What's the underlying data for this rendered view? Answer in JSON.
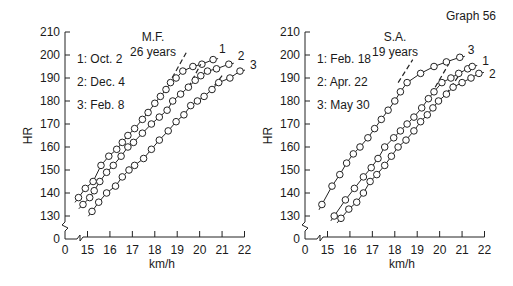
{
  "graph_label": "Graph 56",
  "chart_data": [
    {
      "type": "line",
      "title": "M.F.",
      "subtitle": "26 years",
      "xlabel": "km/h",
      "ylabel": "HR",
      "x_ticks": [
        "0",
        "15",
        "16",
        "17",
        "18",
        "19",
        "20",
        "21",
        "22"
      ],
      "y_ticks": [
        "0",
        "130",
        "140",
        "150",
        "160",
        "170",
        "180",
        "190",
        "200",
        "210"
      ],
      "xlim": [
        14.3,
        22
      ],
      "ylim": [
        125,
        210
      ],
      "axis_breaks": true,
      "grid": false,
      "legend_position": "top-left",
      "legend": [
        "1: Oct. 2",
        "2: Dec. 4",
        "3: Feb. 8"
      ],
      "series": [
        {
          "name": "1",
          "label": "1: Oct. 2",
          "x": [
            14.6,
            14.9,
            15.25,
            15.6,
            15.95,
            16.3,
            16.55,
            16.8,
            17.1,
            17.45,
            17.7,
            18.0,
            18.25,
            18.5,
            18.7,
            18.95,
            19.25,
            19.7,
            20.1,
            20.6
          ],
          "y": [
            138,
            142,
            145,
            152,
            156,
            159,
            162,
            165,
            168,
            172,
            175,
            179,
            182,
            185,
            188,
            190,
            193,
            195,
            196,
            198
          ],
          "deflection_dashed": {
            "x": [
              18.6,
              19.4
            ],
            "y": [
              187,
              201
            ]
          }
        },
        {
          "name": "2",
          "label": "2: Dec. 4",
          "x": [
            14.8,
            15.1,
            15.3,
            15.55,
            15.85,
            16.15,
            16.5,
            16.8,
            17.05,
            17.45,
            17.85,
            18.2,
            18.55,
            18.8,
            19.15,
            19.5,
            19.8,
            20.05,
            20.35,
            20.75,
            21.3
          ],
          "y": [
            135,
            138,
            141,
            145,
            149,
            152,
            156,
            160,
            162,
            166,
            170,
            173,
            176,
            180,
            183,
            186,
            189,
            191,
            193,
            194,
            196
          ],
          "deflection_dashed": {
            "x": [
              19.5,
              20.05
            ],
            "y": [
              186,
              196
            ]
          }
        },
        {
          "name": "3",
          "label": "3: Feb. 8",
          "x": [
            15.2,
            15.5,
            15.85,
            16.25,
            16.55,
            16.85,
            17.1,
            17.5,
            17.85,
            18.2,
            18.6,
            18.95,
            19.3,
            19.6,
            19.9,
            20.2,
            20.55,
            20.85,
            21.35,
            21.8
          ],
          "y": [
            132,
            136,
            140,
            143,
            147,
            150,
            152,
            155,
            159,
            163,
            167,
            171,
            174,
            178,
            180,
            182,
            185,
            188,
            190,
            193
          ],
          "deflection_dashed": {
            "x": [
              20.45,
              21.0
            ],
            "y": [
              184,
              191
            ]
          }
        }
      ],
      "series_end_labels": [
        "1",
        "2",
        "3"
      ]
    },
    {
      "type": "line",
      "title": "S.A.",
      "subtitle": "19 years",
      "xlabel": "km/h",
      "ylabel": "HR",
      "x_ticks": [
        "0",
        "15",
        "16",
        "17",
        "18",
        "19",
        "20",
        "21",
        "22"
      ],
      "y_ticks": [
        "0",
        "130",
        "140",
        "150",
        "160",
        "170",
        "180",
        "190",
        "200",
        "210"
      ],
      "xlim": [
        14.3,
        22
      ],
      "ylim": [
        125,
        210
      ],
      "axis_breaks": true,
      "grid": false,
      "legend_position": "top-left",
      "legend": [
        "1: Feb. 18",
        "2: Apr. 22",
        "3: May 30"
      ],
      "series": [
        {
          "name": "3",
          "label": "3: May 30",
          "x": [
            14.75,
            15.2,
            15.55,
            15.85,
            16.15,
            16.45,
            16.8,
            17.1,
            17.4,
            17.7,
            18.0,
            18.25,
            18.55,
            19.15,
            19.75,
            20.3,
            20.9
          ],
          "y": [
            135,
            143,
            148,
            153,
            157,
            160,
            164,
            168,
            172,
            176,
            180,
            184,
            188,
            192,
            195,
            197,
            199
          ],
          "deflection_dashed": {
            "x": [
              18.15,
              18.8
            ],
            "y": [
              188,
              198
            ]
          }
        },
        {
          "name": "1",
          "label": "1: Feb. 18",
          "x": [
            15.3,
            15.8,
            16.2,
            16.6,
            16.95,
            17.25,
            17.55,
            17.95,
            18.25,
            18.55,
            18.85,
            19.2,
            19.5,
            19.75,
            20.1,
            20.5,
            20.85,
            21.25,
            21.45
          ],
          "y": [
            130,
            137,
            142,
            147,
            151,
            155,
            160,
            164,
            167,
            170,
            173,
            177,
            181,
            184,
            188,
            190,
            192,
            194,
            195
          ],
          "deflection_dashed": {
            "x": [
              19.8,
              20.4
            ],
            "y": [
              186,
              196
            ]
          }
        },
        {
          "name": "2",
          "label": "2: Apr. 22",
          "x": [
            15.6,
            15.95,
            16.3,
            16.6,
            16.9,
            17.2,
            17.55,
            17.85,
            18.15,
            18.5,
            18.85,
            19.15,
            19.45,
            19.7,
            19.95,
            20.3,
            20.6,
            21.0,
            21.4,
            21.75
          ],
          "y": [
            129,
            133,
            136,
            140,
            145,
            148,
            152,
            156,
            160,
            163,
            167,
            171,
            174,
            177,
            180,
            183,
            186,
            188,
            190,
            192
          ],
          "deflection_dashed": {
            "x": [
              20.3,
              20.85
            ],
            "y": [
              183,
              191
            ]
          }
        }
      ],
      "series_end_labels": [
        "3",
        "1",
        "2"
      ]
    }
  ]
}
